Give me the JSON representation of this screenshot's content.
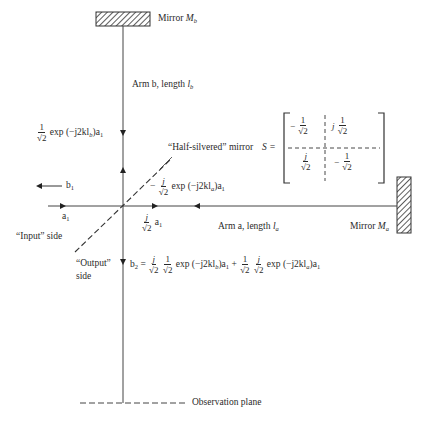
{
  "mirrors": {
    "mb": {
      "label_prefix": "Mirror ",
      "label_symbol": "M",
      "label_sub": "b"
    },
    "ma": {
      "label_prefix": "Mirror ",
      "label_symbol": "M",
      "label_sub": "a"
    }
  },
  "arms": {
    "b": {
      "text": "Arm b, length ",
      "symbol": "l",
      "sub": "b"
    },
    "a": {
      "text": "Arm a, length ",
      "symbol": "l",
      "sub": "a"
    }
  },
  "beam_splitter": {
    "label": "“Half-silvered” mirror",
    "matrix_symbol": "S =",
    "matrix": [
      [
        {
          "sign": "−",
          "num": "1",
          "den": "√2"
        },
        {
          "sign": "",
          "prefix": "j",
          "num": "1",
          "den": "√2"
        }
      ],
      [
        {
          "sign": "",
          "num": "j",
          "den": "√2"
        },
        {
          "sign": "−",
          "num": "1",
          "den": "√2"
        }
      ]
    ]
  },
  "signals": {
    "arm_b_return": {
      "num": "1",
      "den": "√2",
      "expr": "exp (−j2kl",
      "sub": "b",
      "tail": ")a",
      "tail_sub": "1"
    },
    "arm_a_return": {
      "sign": "−",
      "num": "j",
      "den": "√2",
      "expr": "exp (−j2kl",
      "sub": "a",
      "tail": ")a",
      "tail_sub": "1"
    },
    "arm_a_forward": {
      "num": "j",
      "den": "√2",
      "tail": "a",
      "tail_sub": "1"
    },
    "b1": {
      "arrow": "←",
      "text": "b",
      "sub": "1"
    },
    "a1": {
      "text": "a",
      "sub": "1"
    },
    "b2": {
      "lhs": "b",
      "lhs_sub": "2",
      "eq": "=",
      "term1": {
        "num1": "j",
        "num2": "1",
        "den": "√2",
        "expr": "exp (−j2kl",
        "sub": "b",
        "tail": ")a",
        "tail_sub": "1"
      },
      "plus": "+",
      "term2": {
        "num1": "1",
        "num2": "j",
        "den": "√2",
        "expr": "exp (−j2kl",
        "sub": "a",
        "tail": ")a",
        "tail_sub": "1"
      }
    }
  },
  "sides": {
    "input": "“Input” side",
    "output_line1": "“Output”",
    "output_line2": "side"
  },
  "observation_plane": "Observation plane"
}
